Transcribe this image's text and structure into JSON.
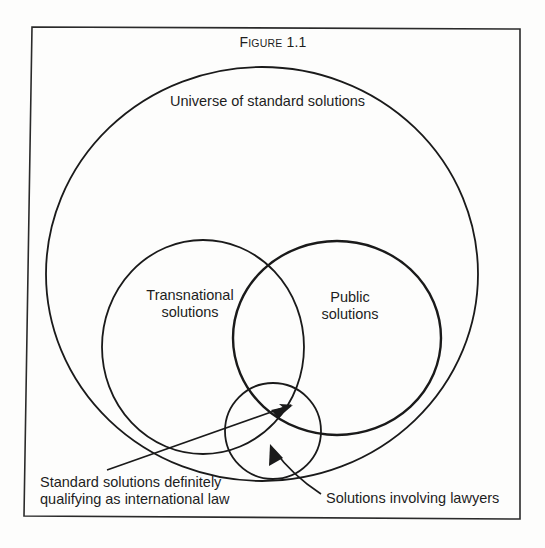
{
  "figure": {
    "title_first_letter": "F",
    "title_rest": "igure",
    "title_number": "1.1",
    "title": "Figure 1.1"
  },
  "sets": {
    "universe": {
      "label": "Universe of standard solutions"
    },
    "transnational": {
      "label_line1": "Transnational",
      "label_line2": "solutions"
    },
    "public": {
      "label_line1": "Public",
      "label_line2": "solutions"
    },
    "lawyers": {
      "label": "Solutions involving lawyers"
    }
  },
  "annotations": {
    "international_law": {
      "line1": "Standard solutions definitely",
      "line2": "qualifying as international law"
    },
    "lawyers": "Solutions involving lawyers"
  },
  "colors": {
    "stroke": "#1a1a1a",
    "background": "#fdfdfc",
    "frame": "#2a2a2a"
  }
}
